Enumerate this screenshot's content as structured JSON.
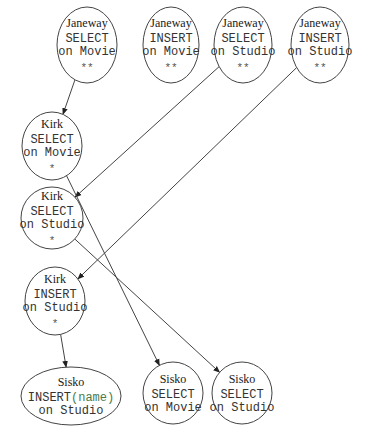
{
  "diagram": {
    "type": "directed-graph",
    "nodes": [
      {
        "id": "j1",
        "user": "Janeway",
        "op": "SELECT",
        "table": "on Movie",
        "lock": "**",
        "shape": "circle",
        "cx": 87,
        "cy": 45,
        "rx": 30,
        "ry": 38
      },
      {
        "id": "j2",
        "user": "Janeway",
        "op": "INSERT",
        "table": "on Movie",
        "lock": "**",
        "shape": "circle",
        "cx": 171,
        "cy": 45,
        "rx": 28,
        "ry": 38
      },
      {
        "id": "j3",
        "user": "Janeway",
        "op": "SELECT",
        "table": "on Studio",
        "lock": "**",
        "shape": "circle",
        "cx": 243,
        "cy": 45,
        "rx": 29,
        "ry": 38
      },
      {
        "id": "j4",
        "user": "Janeway",
        "op": "INSERT",
        "table": "on Studio",
        "lock": "**",
        "shape": "circle",
        "cx": 320,
        "cy": 45,
        "rx": 29,
        "ry": 38
      },
      {
        "id": "k1",
        "user": "Kirk",
        "op": "SELECT",
        "table": "on Movie",
        "lock": "*",
        "shape": "circle",
        "cx": 52,
        "cy": 146,
        "rx": 30,
        "ry": 34
      },
      {
        "id": "k2",
        "user": "Kirk",
        "op": "SELECT",
        "table": "on Studio",
        "lock": "*",
        "shape": "circle",
        "cx": 52,
        "cy": 218,
        "rx": 31,
        "ry": 31
      },
      {
        "id": "k3",
        "user": "Kirk",
        "op": "INSERT",
        "table": "on Studio",
        "lock": "*",
        "shape": "circle",
        "cx": 55,
        "cy": 301,
        "rx": 30,
        "ry": 34
      },
      {
        "id": "s1",
        "user": "Sisko",
        "op": "INSERT",
        "op_suffix": "(name)",
        "table": "on Studio",
        "lock": "",
        "shape": "ellipse",
        "cx": 71,
        "cy": 396,
        "rx": 50,
        "ry": 29
      },
      {
        "id": "s2",
        "user": "Sisko",
        "op": "SELECT",
        "table": "on Movie",
        "lock": "",
        "shape": "circle",
        "cx": 173,
        "cy": 393,
        "rx": 30,
        "ry": 31
      },
      {
        "id": "s3",
        "user": "Sisko",
        "op": "SELECT",
        "table": "on Studio",
        "lock": "",
        "shape": "circle",
        "cx": 242,
        "cy": 393,
        "rx": 30,
        "ry": 31
      }
    ],
    "edges": [
      {
        "from": "j1",
        "to": "k1"
      },
      {
        "from": "j3",
        "to": "k2"
      },
      {
        "from": "j4",
        "to": "k3"
      },
      {
        "from": "k1",
        "to": "s2"
      },
      {
        "from": "k2",
        "to": "s3"
      },
      {
        "from": "k3",
        "to": "s1"
      }
    ],
    "colors": {
      "stroke": "#444444",
      "text": "#1a1a1a",
      "op_suffix": "#4a7a4a",
      "arrow_tip": "#222222"
    }
  }
}
